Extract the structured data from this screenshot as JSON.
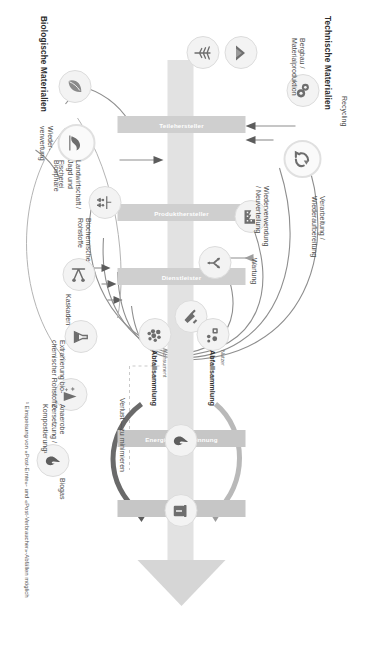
{
  "diagram": {
    "title_technical": "Technische Materialien",
    "title_biological": "Biologische Materialien",
    "footnote": "¹ Einspeisung von «Post-Ernte»- und «Post-Verbraucher»-Abfällen möglich",
    "loss_label": "Verlust —zu minimieren"
  },
  "chain": {
    "columns": [
      {
        "label": "Teilehersteller"
      },
      {
        "label": "Produkthersteller"
      },
      {
        "label": "Dienstleister"
      },
      {
        "label": "Energierückgewinnung"
      },
      {
        "label": "Deponie"
      }
    ]
  },
  "technical": {
    "source_label": "Bergbau /\nMaterialproduktion",
    "loops": [
      {
        "name": "recycling",
        "label": "Recycling"
      },
      {
        "name": "refurbish",
        "label": "Verarbeitung /\nWiederaufbereitung"
      },
      {
        "name": "reuse",
        "label": "Wiederverwendung\n/ Neuverteilung"
      },
      {
        "name": "maintain",
        "label": "Wartung"
      }
    ],
    "icons": [
      {
        "name": "gears-icon"
      },
      {
        "name": "recycling-arrows-icon"
      },
      {
        "name": "factory-icon"
      },
      {
        "name": "redistribute-icon"
      },
      {
        "name": "wrench-icon"
      },
      {
        "name": "mining-icon"
      },
      {
        "name": "extraction-icon"
      }
    ]
  },
  "biological": {
    "source_label": "Landwirtschaft /\nJagd und\nFischerei",
    "feedstock_label": "Biochemische\nRohstoffe",
    "loops": [
      {
        "name": "cascades",
        "label": "Kaskaden"
      },
      {
        "name": "extraction",
        "label": "Extrahierung bio-\nchemischer Rohstoffe¹"
      },
      {
        "name": "anaerobic",
        "label": "Anaerobe\nZersetzung /\nKompostierung¹"
      },
      {
        "name": "biogas",
        "label": "Biogas"
      },
      {
        "name": "regeneration",
        "label": "Wieder-\nverwertung"
      },
      {
        "name": "biosphere",
        "label": "Biosphäre"
      }
    ],
    "icons": [
      {
        "name": "leaf-icon"
      },
      {
        "name": "biosphere-icon"
      },
      {
        "name": "farming-icon"
      },
      {
        "name": "biochemical-icon"
      },
      {
        "name": "cascade-icon"
      },
      {
        "name": "flask-icon"
      },
      {
        "name": "compost-icon"
      },
      {
        "name": "biogas-flame-icon"
      }
    ]
  },
  "collection": [
    {
      "name": "consumer",
      "actor": "Konsument",
      "label": "Abfallsammlung"
    },
    {
      "name": "user",
      "actor": "Nutzer",
      "label": "Abfallsammlung"
    }
  ]
}
